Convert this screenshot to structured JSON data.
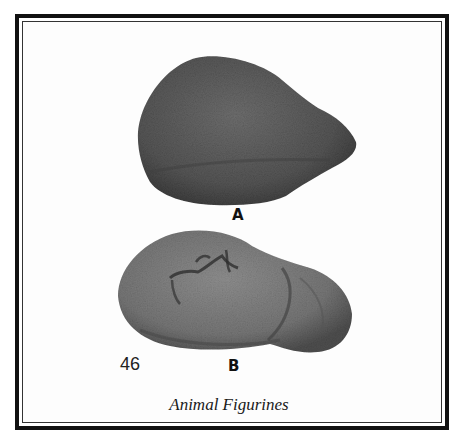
{
  "figure": {
    "caption": "Animal Figurines",
    "page_number": "46",
    "panels": [
      {
        "label": "A",
        "subject": "animal-figurine-a",
        "tone": "#585858"
      },
      {
        "label": "B",
        "subject": "animal-figurine-b",
        "tone": "#7a7a7a"
      }
    ]
  },
  "colors": {
    "border": "#111111",
    "background": "#ffffff",
    "text": "#111111"
  }
}
